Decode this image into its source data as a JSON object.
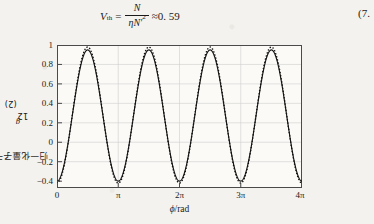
{
  "equation": {
    "lhs_var": "V",
    "lhs_sub": "th",
    "eq_sign": "=",
    "numerator": "N",
    "denominator_eta": "η",
    "denominator_n": "N",
    "denominator_prime": "′",
    "denominator_sup": "2",
    "approx_sign": "≈",
    "value": "0. 59",
    "number": "(7."
  },
  "figure": {
    "ylabel_text": "归一化量子干涉",
    "ylabel_symbol": "g",
    "ylabel_symbol_sub": "12",
    "ylabel_symbol_sup": "(2)",
    "xlabel_symbol": "ϕ",
    "xlabel_unit": "/rad",
    "yticks": [
      "1",
      "0.8",
      "0.6",
      "0.4",
      "0.2",
      "0",
      "−0.2",
      "−0.4"
    ],
    "xticks": [
      "0",
      "π",
      "2π",
      "3π",
      "4π"
    ],
    "line_color": "#141414",
    "grid_color": "#c8c8c8",
    "frame_color": "#555555"
  },
  "chart_data": {
    "type": "line",
    "title": "",
    "xlabel": "ϕ/rad",
    "ylabel": "归一化量子干涉 g12(2)",
    "xlim": [
      0,
      12.566370614
    ],
    "ylim": [
      -0.4,
      1.05
    ],
    "xtick_values": [
      0,
      3.14159265,
      6.28318531,
      9.42477796,
      12.56637061
    ],
    "xtick_labels": [
      "0",
      "π",
      "2π",
      "3π",
      "4π"
    ],
    "ytick_values": [
      1,
      0.8,
      0.6,
      0.4,
      0.2,
      0,
      -0.2,
      -0.4
    ],
    "ytick_labels": [
      "1",
      "0.8",
      "0.6",
      "0.4",
      "0.2",
      "0",
      "-0.2",
      "-0.4"
    ],
    "grid": true,
    "legend": "none",
    "periods": 4,
    "series": [
      {
        "name": "theory-smooth",
        "style": "solid",
        "color": "#141414",
        "amplitude": 0.665,
        "offset": 0.335,
        "phase_shift_rad": 3.14159265,
        "min": -0.33,
        "max": 1.0,
        "description": "smooth cosine-like curve, 4 periods from 0 to 4pi, minimum -0.33 at phi=0, maxima 1.0 at phi=pi/2+k*pi... actually peaks near 0.8pi, 2.8pi spacing pi"
      },
      {
        "name": "simulation-dotted",
        "style": "dotted",
        "color": "#141414",
        "amplitude": 0.69,
        "offset": 0.34,
        "min": -0.35,
        "max": 1.03,
        "description": "dotted/markered trace overlapping the solid curve, slightly overshooting at peaks and troughs"
      }
    ],
    "x_samples": [
      0,
      0.3927,
      0.7854,
      1.1781,
      1.5708,
      1.9635,
      2.3562,
      2.7489,
      3.1416,
      3.5343,
      3.927,
      4.3197,
      4.7124,
      5.1051,
      5.4978,
      5.8905,
      6.2832,
      6.6759,
      7.0686,
      7.4613,
      7.854,
      8.2467,
      8.6394,
      9.0321,
      9.4248,
      9.8175,
      10.2102,
      10.6029,
      10.9956,
      11.3883,
      11.781,
      12.1737,
      12.5664
    ],
    "y_samples": [
      -0.33,
      -0.14,
      0.34,
      0.76,
      1.0,
      0.93,
      0.55,
      0.09,
      -0.3,
      -0.14,
      0.34,
      0.76,
      1.0,
      0.93,
      0.55,
      0.09,
      -0.3,
      -0.14,
      0.34,
      0.76,
      1.0,
      0.93,
      0.55,
      0.09,
      -0.3,
      -0.14,
      0.34,
      0.76,
      1.0,
      0.93,
      0.55,
      0.09,
      -0.3
    ]
  }
}
